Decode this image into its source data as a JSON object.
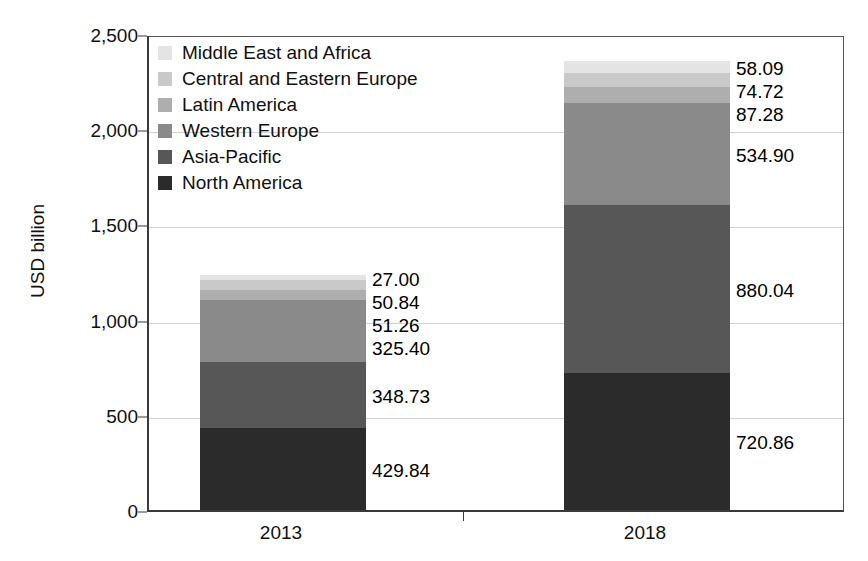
{
  "chart_data": {
    "type": "bar",
    "stacked": true,
    "title": "",
    "subtitle": "",
    "xlabel": "",
    "ylabel": "USD billion",
    "categories": [
      "2013",
      "2018"
    ],
    "ylim": [
      0,
      2500
    ],
    "yticks": [
      0,
      500,
      1000,
      1500,
      2000,
      2500
    ],
    "ytick_labels": [
      "0",
      "500",
      "1,000",
      "1,500",
      "2,000",
      "2,500"
    ],
    "grid": true,
    "legend_position": "top-left",
    "series": [
      {
        "name": "North America",
        "color": "#2b2b2b",
        "values": [
          429.84,
          720.86
        ],
        "labels": [
          "429.84",
          "720.86"
        ]
      },
      {
        "name": "Asia-Pacific",
        "color": "#575757",
        "values": [
          348.73,
          880.04
        ],
        "labels": [
          "348.73",
          "880.04"
        ]
      },
      {
        "name": "Western Europe",
        "color": "#8a8a8a",
        "values": [
          325.4,
          534.9
        ],
        "labels": [
          "325.40",
          "534.90"
        ]
      },
      {
        "name": "Latin America",
        "color": "#aeaeae",
        "values": [
          51.26,
          87.28
        ],
        "labels": [
          "51.26",
          "87.28"
        ]
      },
      {
        "name": "Central and Eastern Europe",
        "color": "#c9c9c9",
        "values": [
          50.84,
          74.72
        ],
        "labels": [
          "50.84",
          "74.72"
        ]
      },
      {
        "name": "Middle East and Africa",
        "color": "#e4e4e4",
        "values": [
          27.0,
          58.09
        ],
        "labels": [
          "27.00",
          "58.09"
        ]
      }
    ],
    "totals": [
      1233.07,
      2355.89
    ]
  },
  "legend": {
    "items": [
      {
        "label": "Middle East and Africa",
        "color": "#e4e4e4"
      },
      {
        "label": "Central and Eastern Europe",
        "color": "#c9c9c9"
      },
      {
        "label": "Latin America",
        "color": "#aeaeae"
      },
      {
        "label": "Western Europe",
        "color": "#8a8a8a"
      },
      {
        "label": "Asia-Pacific",
        "color": "#575757"
      },
      {
        "label": "North America",
        "color": "#2b2b2b"
      }
    ]
  },
  "axis": {
    "y_title": "USD billion",
    "y_tick_labels": [
      "2,500",
      "2,000",
      "1,500",
      "1,000",
      "500",
      "0"
    ],
    "x_tick_labels": [
      "2013",
      "2018"
    ]
  },
  "data_labels": {
    "2013": [
      "27.00",
      "50.84",
      "51.26",
      "325.40",
      "348.73",
      "429.84"
    ],
    "2018": [
      "58.09",
      "74.72",
      "87.28",
      "534.90",
      "880.04",
      "720.86"
    ]
  },
  "style": {
    "axis_color": "#3a3a3a",
    "grid_color": "#d2d2d2",
    "background": "#ffffff",
    "text_color": "#111111"
  }
}
